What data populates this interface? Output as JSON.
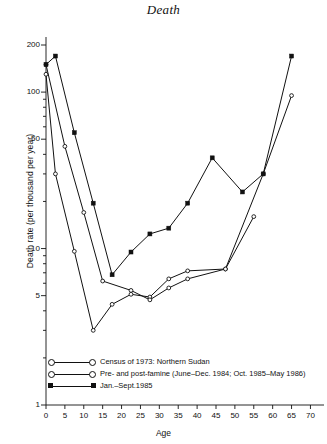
{
  "title": "Death",
  "axes": {
    "xlabel": "Age",
    "ylabel": "Death rate (per thousand per year)",
    "yticks": [
      "200",
      "100",
      "50",
      "10",
      "5",
      "1"
    ],
    "xticks": [
      "0",
      "5",
      "10",
      "15",
      "20",
      "25",
      "30",
      "35",
      "40",
      "45",
      "50",
      "55",
      "60",
      "65",
      "70"
    ]
  },
  "legend": {
    "items": [
      {
        "label": "Census of 1973: Northern Sudan",
        "marker": "open-circle"
      },
      {
        "label": "Pre- and post-famine (June–Dec. 1984; Oct. 1985–May 1986)",
        "marker": "open-circle"
      },
      {
        "label": "Jan.–Sept.1985",
        "marker": "filled-square"
      }
    ]
  },
  "colors": {
    "line": "#111111",
    "background": "#ffffff"
  },
  "chart_data": {
    "type": "line",
    "title": "Death",
    "xlabel": "Age",
    "ylabel": "Death rate (per thousand per year)",
    "yscale": "log",
    "ylim": [
      1,
      200
    ],
    "xlim": [
      0,
      72
    ],
    "grid": false,
    "legend_position": "bottom-left",
    "yticks": [
      1,
      5,
      10,
      50,
      100,
      200
    ],
    "xticks": [
      0,
      5,
      10,
      15,
      20,
      25,
      30,
      35,
      40,
      45,
      50,
      55,
      60,
      65,
      70
    ],
    "series": [
      {
        "name": "Census of 1973: Northern Sudan",
        "marker": "open-circle",
        "x": [
          0,
          2.5,
          7.5,
          12.5,
          17.5,
          22.5,
          27.5,
          32.5,
          37.5,
          47.5,
          55
        ],
        "y": [
          130,
          30,
          9.6,
          3.0,
          4.4,
          5.1,
          4.9,
          6.4,
          7.2,
          7.4,
          16
        ]
      },
      {
        "name": "Pre- and post-famine (June–Dec. 1984; Oct. 1985–May 1986)",
        "marker": "open-circle",
        "x": [
          0,
          5,
          10,
          15,
          22.5,
          27.5,
          32.5,
          37.5,
          47.5,
          57.5,
          65
        ],
        "y": [
          150,
          45,
          17,
          6.2,
          5.4,
          4.7,
          5.6,
          6.4,
          7.4,
          30,
          95
        ]
      },
      {
        "name": "Jan.–Sept.1985",
        "marker": "filled-square",
        "x": [
          0,
          2.5,
          7.5,
          12.5,
          17.5,
          22.5,
          27.5,
          32.5,
          37.5,
          44,
          52,
          57.5,
          65
        ],
        "y": [
          150,
          170,
          55,
          19.5,
          6.8,
          9.5,
          12.4,
          13.5,
          19.5,
          38,
          23,
          30,
          170
        ]
      }
    ]
  }
}
